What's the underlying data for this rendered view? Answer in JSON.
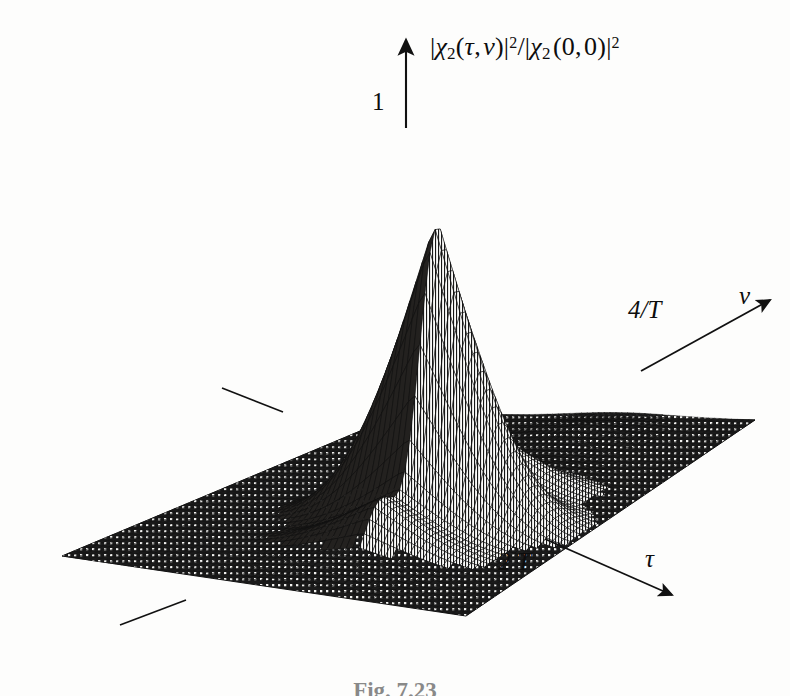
{
  "figure": {
    "kind": "3d-mesh-surface-plot",
    "caption": "Fig. 7.23",
    "background_color": "#fdfdfc",
    "ink_color": "#111111"
  },
  "axes": {
    "z": {
      "label_plain": "|χ₂(τ,ν)|²/|χ₂(0,0)|²",
      "tick_label": "1",
      "arrow": "up"
    },
    "nu": {
      "label": "ν",
      "tick_label": "4/T",
      "arrow": "up-right"
    },
    "tau": {
      "label": "τ",
      "tick_label": "2 T",
      "arrow": "down-right"
    }
  },
  "chart_data": {
    "type": "surface",
    "title": "",
    "subtitle": "",
    "xlabel": "τ",
    "ylabel": "ν",
    "zlabel": "|χ₂(τ,ν)|²/|χ₂(0,0)|²",
    "xlim": [
      -1,
      1
    ],
    "ylim": [
      -1,
      1
    ],
    "zlim": [
      0,
      1
    ],
    "x_tick_labels": [
      "2 T"
    ],
    "y_tick_labels": [
      "4/T"
    ],
    "z_tick_labels": [
      "1"
    ],
    "grid": false,
    "legend": false,
    "peak_value": 1,
    "peak_position": {
      "tau": 0,
      "nu": 0
    },
    "mesh": {
      "n_tau": 61,
      "n_nu": 61,
      "line_color": "#111111"
    },
    "series": [
      {
        "name": "main-lobe",
        "peak": 1.0,
        "tau_extent": [
          -0.28,
          0.28
        ],
        "nu_extent": [
          -0.22,
          0.22
        ]
      },
      {
        "name": "nu-sidelobe-ridges",
        "relative_heights": [
          0.34,
          0.22,
          0.16,
          0.12,
          0.09,
          0.07
        ],
        "direction": "nu"
      },
      {
        "name": "tau-skirt",
        "relative_heights": [
          0.3,
          0.18,
          0.11,
          0.07,
          0.04
        ],
        "direction": "tau"
      }
    ]
  },
  "annotations": {
    "tick_marks": [
      {
        "name": "nu-axis-tick-upper-left",
        "x1": 222,
        "y1": 388,
        "x2": 283,
        "y2": 412
      },
      {
        "name": "tau-axis-tick-lower-left",
        "x1": 120,
        "y1": 625,
        "x2": 186,
        "y2": 600
      }
    ]
  }
}
